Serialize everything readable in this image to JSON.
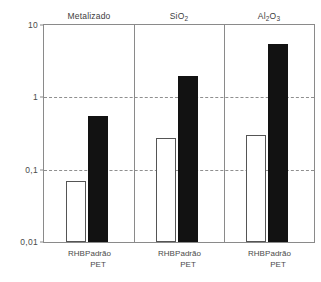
{
  "stray_top_text": "",
  "chart_data": {
    "type": "bar",
    "title": "",
    "xlabel": "",
    "ylabel": "",
    "scale": "log",
    "ylim": [
      0.01,
      10
    ],
    "grid": true,
    "legend_position": "none",
    "y_ticks": [
      "10",
      "1",
      "0,1",
      "0,01"
    ],
    "y_tick_values": [
      10,
      1,
      0.1,
      0.01
    ],
    "panels": [
      {
        "title": "Metalizado",
        "title_html": "Metalizado",
        "categories": [
          "RHB",
          "Padrão PET"
        ],
        "series": [
          {
            "name": "RHB",
            "style": "open",
            "value": 0.07
          },
          {
            "name": "Padrão PET",
            "style": "filled",
            "value": 0.55
          }
        ]
      },
      {
        "title": "SiO2",
        "title_html": "SiO<sub>2</sub>",
        "categories": [
          "RHB",
          "Padrão PET"
        ],
        "series": [
          {
            "name": "RHB",
            "style": "open",
            "value": 0.27
          },
          {
            "name": "Padrão PET",
            "style": "filled",
            "value": 2.0
          }
        ]
      },
      {
        "title": "Al2O3",
        "title_html": "Al<sub>2</sub>O<sub>3</sub>",
        "categories": [
          "RHB",
          "Padrão PET"
        ],
        "series": [
          {
            "name": "RHB",
            "style": "open",
            "value": 0.3
          },
          {
            "name": "Padrão PET",
            "style": "filled",
            "value": 5.5
          }
        ]
      }
    ],
    "x_tick_labels": [
      {
        "line1": "RHB",
        "line2": ""
      },
      {
        "line1": "Padrão",
        "line2": "PET"
      }
    ]
  },
  "colors": {
    "bar_open_fill": "#ffffff",
    "bar_open_stroke": "#555555",
    "bar_filled": "#121212",
    "axis": "#8a8a8a",
    "grid": "#8f8f8f",
    "text": "#4a4a4a"
  }
}
